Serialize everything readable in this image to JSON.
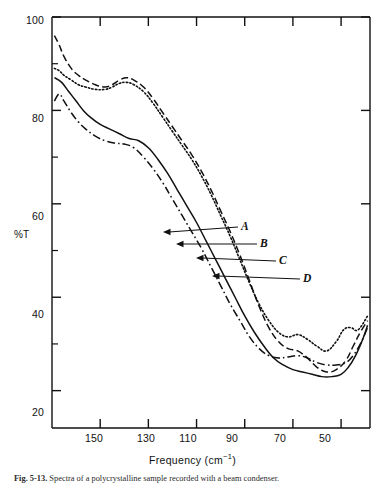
{
  "chart_data": {
    "type": "line",
    "title": "",
    "xlabel": "Frequency (cm−1)",
    "ylabel": "%T",
    "xlim": [
      170,
      38
    ],
    "ylim": [
      12,
      100
    ],
    "x_ticks": [
      150,
      130,
      110,
      90,
      70,
      50
    ],
    "x_tick_labels": [
      "150",
      "130",
      "110",
      "90",
      "70",
      "50"
    ],
    "y_ticks": [
      20,
      40,
      60,
      80,
      100
    ],
    "y_tick_labels": [
      "20",
      "40",
      "60",
      "80",
      "100"
    ],
    "y_minor_ticks": [
      30,
      50,
      70,
      90
    ],
    "grid": false,
    "legend_position": "inline-annotations",
    "series": [
      {
        "name": "A",
        "style": "dash-dot",
        "label": "A",
        "points": [
          [
            169,
            82.0
          ],
          [
            167,
            83.5
          ],
          [
            165,
            82.0
          ],
          [
            162,
            79.5
          ],
          [
            159,
            77.5
          ],
          [
            156,
            76.0
          ],
          [
            152,
            74.5
          ],
          [
            148,
            73.5
          ],
          [
            144,
            73.0
          ],
          [
            140,
            72.8
          ],
          [
            136,
            72.0
          ],
          [
            132,
            70.0
          ],
          [
            128,
            67.5
          ],
          [
            124,
            64.5
          ],
          [
            120,
            61.0
          ],
          [
            116,
            57.5
          ],
          [
            112,
            54.0
          ],
          [
            108,
            50.5
          ],
          [
            104,
            46.5
          ],
          [
            100,
            42.5
          ],
          [
            96,
            38.5
          ],
          [
            92,
            35.0
          ],
          [
            88,
            31.5
          ],
          [
            84,
            29.0
          ],
          [
            80,
            27.5
          ],
          [
            76,
            27.0
          ],
          [
            72,
            27.2
          ],
          [
            68,
            27.5
          ],
          [
            64,
            27.0
          ],
          [
            60,
            26.0
          ],
          [
            56,
            25.5
          ],
          [
            52,
            25.5
          ],
          [
            48,
            26.0
          ],
          [
            45,
            27.5
          ],
          [
            42,
            30.0
          ],
          [
            39,
            33.5
          ]
        ]
      },
      {
        "name": "B",
        "style": "solid",
        "label": "B",
        "points": [
          [
            169,
            87.0
          ],
          [
            166,
            86.0
          ],
          [
            163,
            84.0
          ],
          [
            160,
            82.0
          ],
          [
            157,
            80.0
          ],
          [
            154,
            78.5
          ],
          [
            150,
            77.0
          ],
          [
            146,
            76.0
          ],
          [
            142,
            75.0
          ],
          [
            138,
            74.0
          ],
          [
            134,
            73.5
          ],
          [
            130,
            72.0
          ],
          [
            126,
            69.5
          ],
          [
            122,
            66.5
          ],
          [
            118,
            63.0
          ],
          [
            114,
            59.5
          ],
          [
            110,
            56.0
          ],
          [
            106,
            52.0
          ],
          [
            102,
            48.0
          ],
          [
            98,
            44.0
          ],
          [
            94,
            40.0
          ],
          [
            90,
            36.0
          ],
          [
            86,
            32.5
          ],
          [
            82,
            29.5
          ],
          [
            78,
            27.0
          ],
          [
            74,
            25.5
          ],
          [
            70,
            24.5
          ],
          [
            66,
            24.0
          ],
          [
            62,
            23.5
          ],
          [
            58,
            23.0
          ],
          [
            54,
            23.0
          ],
          [
            50,
            23.5
          ],
          [
            47,
            25.0
          ],
          [
            44,
            27.5
          ],
          [
            41,
            31.0
          ],
          [
            39,
            34.0
          ]
        ]
      },
      {
        "name": "C",
        "style": "dashed",
        "label": "C",
        "points": [
          [
            169,
            96.0
          ],
          [
            167,
            94.0
          ],
          [
            165,
            91.5
          ],
          [
            162,
            89.0
          ],
          [
            159,
            87.5
          ],
          [
            156,
            86.5
          ],
          [
            152,
            85.5
          ],
          [
            148,
            85.0
          ],
          [
            145,
            85.5
          ],
          [
            142,
            86.5
          ],
          [
            139,
            87.0
          ],
          [
            136,
            86.5
          ],
          [
            132,
            85.0
          ],
          [
            128,
            82.5
          ],
          [
            124,
            79.5
          ],
          [
            120,
            76.5
          ],
          [
            116,
            73.5
          ],
          [
            112,
            70.5
          ],
          [
            108,
            67.0
          ],
          [
            104,
            63.0
          ],
          [
            100,
            58.5
          ],
          [
            96,
            54.0
          ],
          [
            92,
            49.0
          ],
          [
            88,
            43.5
          ],
          [
            84,
            38.0
          ],
          [
            80,
            33.5
          ],
          [
            76,
            30.5
          ],
          [
            72,
            29.0
          ],
          [
            68,
            28.5
          ],
          [
            64,
            27.0
          ],
          [
            60,
            25.0
          ],
          [
            56,
            24.0
          ],
          [
            52,
            24.5
          ],
          [
            48,
            26.5
          ],
          [
            45,
            29.5
          ],
          [
            42,
            32.5
          ],
          [
            39,
            35.0
          ]
        ]
      },
      {
        "name": "D",
        "style": "dotted",
        "label": "D",
        "points": [
          [
            169,
            89.0
          ],
          [
            167,
            88.5
          ],
          [
            165,
            87.5
          ],
          [
            162,
            86.5
          ],
          [
            159,
            85.5
          ],
          [
            156,
            85.0
          ],
          [
            152,
            84.5
          ],
          [
            148,
            84.5
          ],
          [
            145,
            85.0
          ],
          [
            142,
            85.8
          ],
          [
            139,
            86.0
          ],
          [
            136,
            85.5
          ],
          [
            132,
            84.0
          ],
          [
            128,
            81.5
          ],
          [
            124,
            78.5
          ],
          [
            120,
            75.5
          ],
          [
            116,
            72.5
          ],
          [
            112,
            69.5
          ],
          [
            108,
            66.0
          ],
          [
            104,
            62.0
          ],
          [
            100,
            57.5
          ],
          [
            96,
            53.0
          ],
          [
            92,
            48.0
          ],
          [
            88,
            43.0
          ],
          [
            84,
            38.5
          ],
          [
            80,
            35.0
          ],
          [
            76,
            32.5
          ],
          [
            72,
            31.5
          ],
          [
            68,
            32.0
          ],
          [
            64,
            31.0
          ],
          [
            60,
            29.5
          ],
          [
            56,
            28.5
          ],
          [
            52,
            30.5
          ],
          [
            49,
            33.0
          ],
          [
            46,
            33.5
          ],
          [
            43,
            33.0
          ],
          [
            39,
            36.0
          ]
        ]
      }
    ],
    "annotations": [
      {
        "label": "A",
        "target_series": "A"
      },
      {
        "label": "B",
        "target_series": "B"
      },
      {
        "label": "C",
        "target_series": "C"
      },
      {
        "label": "D",
        "target_series": "D"
      }
    ]
  },
  "axis": {
    "y_title": "%T",
    "x_title_main": "Frequency  (cm",
    "x_title_sup": "−1",
    "x_title_close": ")"
  },
  "caption": {
    "figure_number": "Fig. 5-13.",
    "text": "Spectra of a polycrystalline sample recorded with a beam condenser."
  }
}
